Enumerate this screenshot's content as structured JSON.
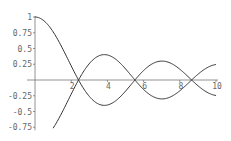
{
  "chart_data": {
    "type": "line",
    "title": "",
    "xlabel": "",
    "ylabel": "",
    "xlim": [
      0,
      10
    ],
    "ylim": [
      -0.75,
      1
    ],
    "grid": false,
    "legend": null,
    "x_ticks": [
      {
        "value": 2,
        "label": "2"
      },
      {
        "value": 4,
        "label": "4"
      },
      {
        "value": 6,
        "label": "6"
      },
      {
        "value": 8,
        "label": "8"
      },
      {
        "value": 10,
        "label": "10"
      }
    ],
    "y_ticks": [
      {
        "value": 1,
        "label": "1"
      },
      {
        "value": 0.75,
        "label": "0.75"
      },
      {
        "value": 0.5,
        "label": "0.5"
      },
      {
        "value": 0.25,
        "label": "0.25"
      },
      {
        "value": -0.25,
        "label": "-0.25"
      },
      {
        "value": -0.5,
        "label": "-0.5"
      },
      {
        "value": -0.75,
        "label": "-0.75"
      }
    ],
    "series": [
      {
        "name": "J0(x)",
        "x": [
          0,
          0.5,
          1,
          1.5,
          2,
          2.405,
          3,
          3.832,
          4.5,
          5.52,
          6,
          7.016,
          8,
          8.654,
          9,
          10
        ],
        "values": [
          1,
          0.938,
          0.765,
          0.512,
          0.224,
          0,
          -0.26,
          -0.403,
          -0.321,
          0,
          0.151,
          0.3,
          0.172,
          0,
          -0.09,
          -0.246
        ]
      },
      {
        "name": "-J0(x)",
        "x": [
          1,
          1.5,
          2,
          2.405,
          3,
          3.832,
          4.5,
          5.52,
          6,
          7.016,
          8,
          8.654,
          9,
          10
        ],
        "values": [
          -0.765,
          -0.512,
          -0.224,
          0,
          0.26,
          0.403,
          0.321,
          0,
          -0.151,
          -0.3,
          -0.172,
          0,
          0.09,
          0.246
        ]
      }
    ],
    "colors": {
      "curve": "#333333",
      "axis": "#777777",
      "tick_label": "#666666"
    }
  }
}
